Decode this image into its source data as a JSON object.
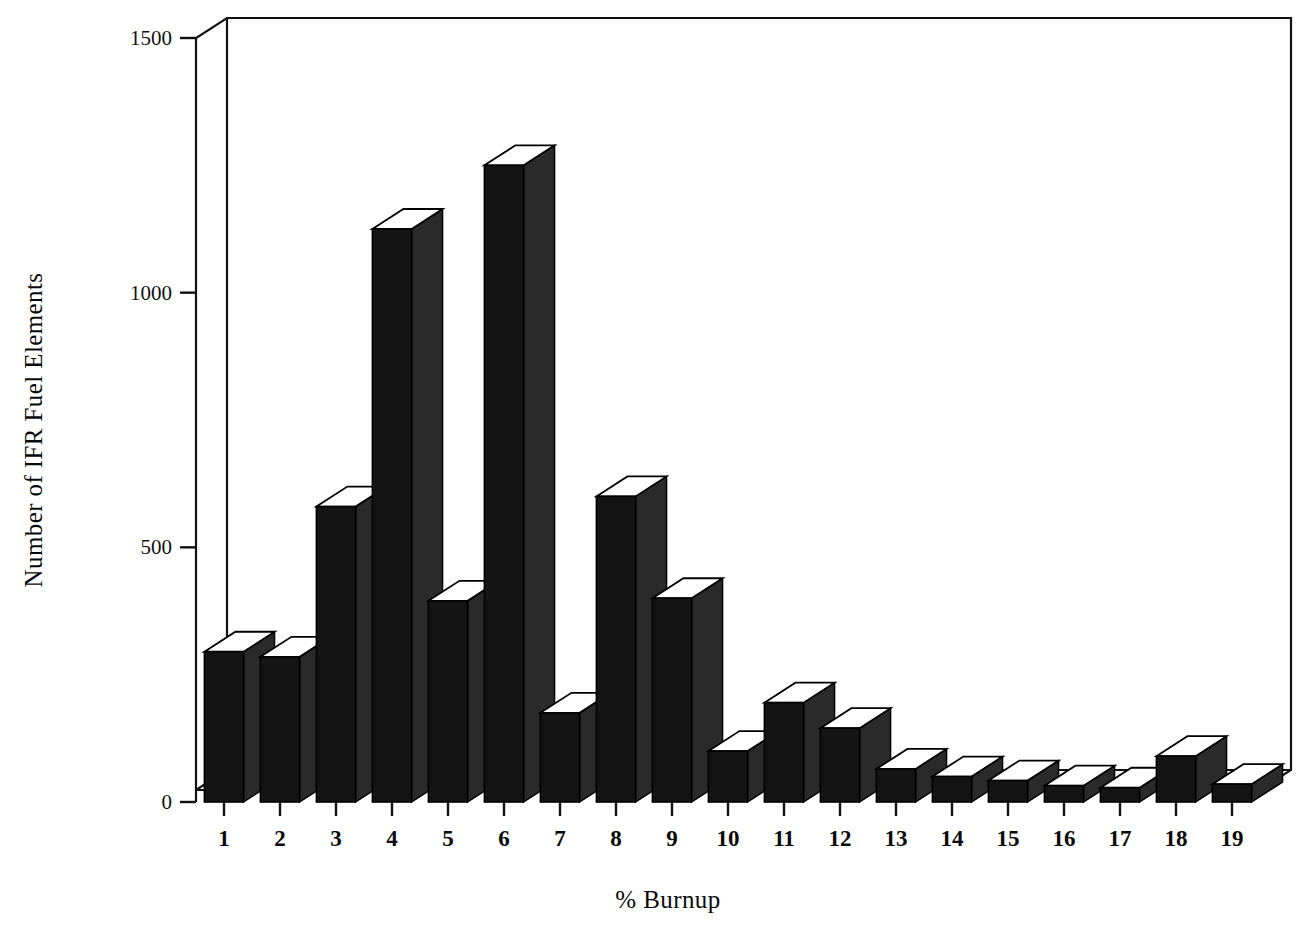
{
  "chart_data": {
    "type": "bar",
    "title": "",
    "subtitle": "",
    "xlabel": "% Burnup",
    "ylabel": "Number of IFR Fuel Elements",
    "categories": [
      "1",
      "2",
      "3",
      "4",
      "5",
      "6",
      "7",
      "8",
      "9",
      "10",
      "11",
      "12",
      "13",
      "14",
      "15",
      "16",
      "17",
      "18",
      "19"
    ],
    "values": [
      295,
      285,
      580,
      1125,
      395,
      1250,
      175,
      600,
      400,
      100,
      195,
      145,
      65,
      50,
      42,
      32,
      28,
      90,
      35
    ],
    "ylim": [
      0,
      1500
    ],
    "yticks": [
      0,
      500,
      1000,
      1500
    ],
    "ytick_labels": [
      "0",
      "500",
      "1000",
      "1500"
    ],
    "xtick_labels": [
      "1",
      "2",
      "3",
      "4",
      "5",
      "6",
      "7",
      "8",
      "9",
      "10",
      "11",
      "12",
      "13",
      "14",
      "15",
      "16",
      "17",
      "18",
      "19"
    ],
    "grid": false,
    "legend": null,
    "style": "3d-column",
    "bar_face_color": "#141414",
    "bar_top_color": "#ffffff",
    "bar_side_color": "#2a2a2a",
    "axis_color": "#111111",
    "background_color": "#ffffff"
  },
  "labels": {
    "y_axis_title": "Number of IFR Fuel Elements",
    "x_axis_title": "% Burnup"
  }
}
